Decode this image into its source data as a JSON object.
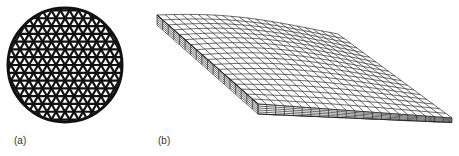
{
  "figure": {
    "panels": [
      {
        "label": "(a)",
        "description": "Circular cross-section with triangular/hexagonal lattice (Kagome-like) pattern",
        "lattice": {
          "rows": 13,
          "cols": 14,
          "pitch": 9
        }
      },
      {
        "label": "(b)",
        "description": "3D wireframe mesh of a curved slab, thinning toward the right tip",
        "mesh": {
          "u_divisions": 22,
          "v_divisions": 18,
          "layers": 5
        }
      }
    ],
    "colors": {
      "ink": "#111111",
      "mesh": "#2a2a2a",
      "background": "#ffffff"
    }
  }
}
